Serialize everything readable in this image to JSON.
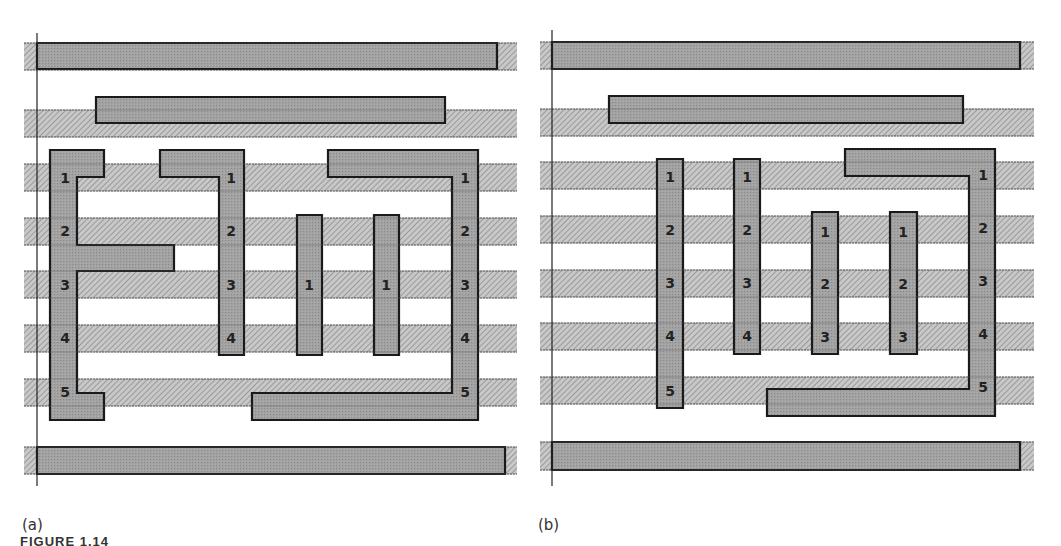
{
  "figure": {
    "caption": "FIGURE 1.14",
    "colors": {
      "stripe_fill": "#c4c4c4",
      "stripe_hatch": "#8a8a8a",
      "stripe_edge": "#6a6a6a",
      "metal_fill": "#9d9d9d",
      "metal_edge": "#1a1a1a",
      "label_color": "#222222",
      "axis_line": "#222222"
    },
    "panels": [
      {
        "id": "a",
        "label": "(a)",
        "label_pos": [
          22,
          516
        ],
        "axis_line": {
          "x": 37,
          "y1": 33,
          "y2": 486
        },
        "stripes": [
          {
            "x1": 24,
            "x2": 517,
            "y": 43,
            "h": 27
          },
          {
            "x1": 24,
            "x2": 517,
            "y": 110,
            "h": 27
          },
          {
            "x1": 24,
            "x2": 517,
            "y": 164,
            "h": 27
          },
          {
            "x1": 24,
            "x2": 517,
            "y": 218,
            "h": 27
          },
          {
            "x1": 24,
            "x2": 517,
            "y": 271,
            "h": 27
          },
          {
            "x1": 24,
            "x2": 517,
            "y": 325,
            "h": 27
          },
          {
            "x1": 24,
            "x2": 517,
            "y": 379,
            "h": 27
          },
          {
            "x1": 24,
            "x2": 517,
            "y": 447,
            "h": 27
          }
        ],
        "shapes": [
          {
            "name": "top-rail",
            "points": "37,43 497,43 497,69 37,69"
          },
          {
            "name": "second-bar",
            "points": "96,97 445,97 445,123 96,123"
          },
          {
            "name": "left-e-shape",
            "points": "50,150 104,150 104,177 77,177 77,245 174,245 174,271 77,271 77,393 104,393 104,420 50,420"
          },
          {
            "name": "hook-shape",
            "points": "160,150 244,150 244,355 219,355 219,177 160,177"
          },
          {
            "name": "pillar-1",
            "points": "297,215 322,215 322,355 297,355"
          },
          {
            "name": "pillar-2",
            "points": "374,215 399,215 399,355 374,355"
          },
          {
            "name": "right-c-shape",
            "points": "328,150 478,150 478,420 252,420 252,393 452,393 452,177 328,177"
          },
          {
            "name": "bottom-rail",
            "points": "37,447 505,447 505,474 37,474"
          }
        ],
        "labels": [
          {
            "text": "1",
            "x": 65,
            "y": 183
          },
          {
            "text": "2",
            "x": 65,
            "y": 236
          },
          {
            "text": "3",
            "x": 65,
            "y": 290
          },
          {
            "text": "4",
            "x": 65,
            "y": 343
          },
          {
            "text": "5",
            "x": 65,
            "y": 397
          },
          {
            "text": "1",
            "x": 231,
            "y": 183
          },
          {
            "text": "2",
            "x": 231,
            "y": 236
          },
          {
            "text": "3",
            "x": 231,
            "y": 290
          },
          {
            "text": "4",
            "x": 231,
            "y": 343
          },
          {
            "text": "1",
            "x": 309,
            "y": 290
          },
          {
            "text": "1",
            "x": 386,
            "y": 290
          },
          {
            "text": "1",
            "x": 465,
            "y": 183
          },
          {
            "text": "2",
            "x": 465,
            "y": 236
          },
          {
            "text": "3",
            "x": 465,
            "y": 290
          },
          {
            "text": "4",
            "x": 465,
            "y": 343
          },
          {
            "text": "5",
            "x": 465,
            "y": 397
          }
        ]
      },
      {
        "id": "b",
        "label": "(b)",
        "label_pos": [
          538,
          516
        ],
        "axis_line": {
          "x": 552,
          "y1": 30,
          "y2": 486
        },
        "stripes": [
          {
            "x1": 540,
            "x2": 1034,
            "y": 42,
            "h": 27
          },
          {
            "x1": 540,
            "x2": 1034,
            "y": 109,
            "h": 27
          },
          {
            "x1": 540,
            "x2": 1034,
            "y": 162,
            "h": 27
          },
          {
            "x1": 540,
            "x2": 1034,
            "y": 216,
            "h": 27
          },
          {
            "x1": 540,
            "x2": 1034,
            "y": 270,
            "h": 27
          },
          {
            "x1": 540,
            "x2": 1034,
            "y": 323,
            "h": 27
          },
          {
            "x1": 540,
            "x2": 1034,
            "y": 377,
            "h": 27
          },
          {
            "x1": 540,
            "x2": 1034,
            "y": 442,
            "h": 28
          }
        ],
        "shapes": [
          {
            "name": "top-rail",
            "points": "552,42 1020,42 1020,69 552,69"
          },
          {
            "name": "second-bar",
            "points": "609,96 963,96 963,123 609,123"
          },
          {
            "name": "pillar-1",
            "points": "657,159 683,159 683,408 657,408"
          },
          {
            "name": "pillar-2",
            "points": "734,159 760,159 760,354 734,354"
          },
          {
            "name": "pillar-3",
            "points": "812,212 838,212 838,354 812,354"
          },
          {
            "name": "pillar-4",
            "points": "890,212 917,212 917,354 890,354"
          },
          {
            "name": "right-l-shape",
            "points": "845,149 995,149 995,416 767,416 767,389 969,389 969,176 845,176"
          },
          {
            "name": "bottom-rail",
            "points": "552,442 1020,442 1020,470 552,470"
          }
        ],
        "labels": [
          {
            "text": "1",
            "x": 670,
            "y": 182
          },
          {
            "text": "2",
            "x": 670,
            "y": 235
          },
          {
            "text": "3",
            "x": 670,
            "y": 288
          },
          {
            "text": "4",
            "x": 670,
            "y": 341
          },
          {
            "text": "5",
            "x": 670,
            "y": 396
          },
          {
            "text": "1",
            "x": 747,
            "y": 182
          },
          {
            "text": "2",
            "x": 747,
            "y": 235
          },
          {
            "text": "3",
            "x": 747,
            "y": 288
          },
          {
            "text": "4",
            "x": 747,
            "y": 341
          },
          {
            "text": "1",
            "x": 825,
            "y": 237
          },
          {
            "text": "2",
            "x": 825,
            "y": 289
          },
          {
            "text": "3",
            "x": 825,
            "y": 342
          },
          {
            "text": "1",
            "x": 903,
            "y": 237
          },
          {
            "text": "2",
            "x": 903,
            "y": 289
          },
          {
            "text": "3",
            "x": 903,
            "y": 342
          },
          {
            "text": "1",
            "x": 983,
            "y": 180
          },
          {
            "text": "2",
            "x": 983,
            "y": 233
          },
          {
            "text": "3",
            "x": 983,
            "y": 286
          },
          {
            "text": "4",
            "x": 983,
            "y": 339
          },
          {
            "text": "5",
            "x": 983,
            "y": 392
          }
        ]
      }
    ]
  }
}
